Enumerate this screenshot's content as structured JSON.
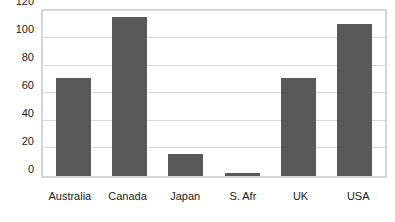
{
  "chart_data": {
    "type": "bar",
    "title": "",
    "subtitle": "",
    "xlabel": "",
    "ylabel": "",
    "categories": [
      "Australia",
      "Canada",
      "Japan",
      "S. Afr",
      "UK",
      "USA"
    ],
    "values": [
      71,
      115,
      16,
      2,
      71,
      110
    ],
    "series": [
      {
        "name": "Series 1",
        "values": [
          71,
          115,
          16,
          2,
          71,
          110
        ]
      }
    ],
    "ylim": [
      0,
      120
    ],
    "xlim": null,
    "y_ticks": [
      120,
      100,
      80,
      60,
      40,
      20,
      0
    ],
    "y_tick_labels": [
      "120",
      "100",
      "80",
      "60",
      "40",
      "20",
      "0"
    ],
    "grid": "horizontal",
    "legend": "none",
    "annotations": [],
    "colors": {
      "bar": "#595959",
      "gridline": "#d9d9d9",
      "plot_border": "#d6d6d6",
      "text": "#1a1a1a",
      "background": "#ffffff"
    }
  }
}
